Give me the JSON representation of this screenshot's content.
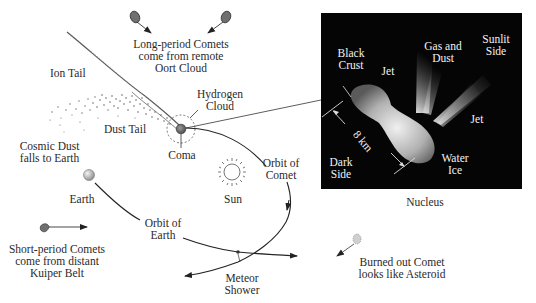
{
  "diagram": {
    "labels": {
      "long_period": [
        "Long-period Comets",
        "come from remote",
        "Oort Cloud"
      ],
      "ion_tail": "Ion Tail",
      "hydrogen_cloud": [
        "Hydrogen",
        "Cloud"
      ],
      "dust_tail": "Dust Tail",
      "cosmic_dust": [
        "Cosmic Dust",
        "falls to Earth"
      ],
      "coma": "Coma",
      "orbit_of_comet": [
        "Orbit of",
        "Comet"
      ],
      "earth": "Earth",
      "sun": "Sun",
      "orbit_of_earth": [
        "Orbit of",
        "Earth"
      ],
      "short_period": [
        "Short-period Comets",
        "come from distant",
        "Kuiper Belt"
      ],
      "meteor_shower": [
        "Meteor",
        "Shower"
      ],
      "burned_out": [
        "Burned out Comet",
        "looks like Asteroid"
      ],
      "nucleus_caption": "Nucleus"
    },
    "nucleus_inset": {
      "black_crust": [
        "Black",
        "Crust"
      ],
      "jet_top": "Jet",
      "gas_and_dust": [
        "Gas and",
        "Dust"
      ],
      "sunlit_side": [
        "Sunlit",
        "Side"
      ],
      "jet_right": "Jet",
      "scale": "8 km",
      "dark_side": [
        "Dark",
        "Side"
      ],
      "water_ice": [
        "Water",
        "Ice"
      ]
    },
    "colors": {
      "line": "#333333",
      "comet_body": "#6b6b6b",
      "inset_bg": "#050505",
      "inset_text": "#f2f2f2"
    }
  }
}
